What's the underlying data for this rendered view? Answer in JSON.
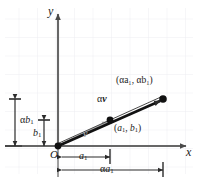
{
  "figure": {
    "type": "vector-scalar-multiplication-diagram",
    "background": "#ffffff",
    "grid_color": "#ededf2",
    "axis_color": "#555555",
    "vector_v_color": "#aaaaaa",
    "vector_av_color": "#111111"
  },
  "axes": {
    "x_label": "x",
    "y_label": "y",
    "origin_label": "O"
  },
  "points": [
    {
      "name": "origin",
      "label": "O",
      "x": 58,
      "y": 146
    },
    {
      "name": "point-v",
      "label": "(a₁, b₁)",
      "x": 110,
      "y": 120
    },
    {
      "name": "point-av",
      "label": "(αa₁, αb₁)",
      "x": 163,
      "y": 99
    }
  ],
  "vectors": [
    {
      "name": "v",
      "label": "v",
      "color": "#aaaaaa",
      "from": "origin",
      "to": "point-v"
    },
    {
      "name": "alpha-v",
      "label": "αv",
      "color": "#111111",
      "from": "origin",
      "to": "point-av"
    }
  ],
  "labels": {
    "point_v": {
      "open": "(",
      "a": "a",
      "a_sub": "1",
      "comma": ", ",
      "b": "b",
      "b_sub": "1",
      "close": ")"
    },
    "point_av": {
      "text": "(αa₁, αb₁)"
    },
    "vector_v": {
      "text": "v"
    },
    "vector_av": {
      "alpha": "α",
      "v": "v"
    },
    "origin": {
      "text": "O"
    },
    "x_axis": {
      "text": "x"
    },
    "y_axis": {
      "text": "y"
    }
  },
  "dimensions": [
    {
      "name": "b1",
      "orientation": "vertical",
      "alpha": "",
      "base": "b",
      "subscript": "1"
    },
    {
      "name": "alpha-b1",
      "orientation": "vertical",
      "alpha": "α",
      "base": "b",
      "subscript": "1"
    },
    {
      "name": "a1",
      "orientation": "horizontal",
      "alpha": "",
      "base": "a",
      "subscript": "1"
    },
    {
      "name": "alpha-a1",
      "orientation": "horizontal",
      "alpha": "α",
      "base": "a",
      "subscript": "1"
    }
  ],
  "dimension_text": {
    "b1_alpha": "",
    "b1_base": "b",
    "b1_sub": "1",
    "ab1_alpha": "α",
    "ab1_base": "b",
    "ab1_sub": "1",
    "a1_alpha": "",
    "a1_base": "a",
    "a1_sub": "1",
    "aa1_alpha": "α",
    "aa1_base": "a",
    "aa1_sub": "1"
  }
}
